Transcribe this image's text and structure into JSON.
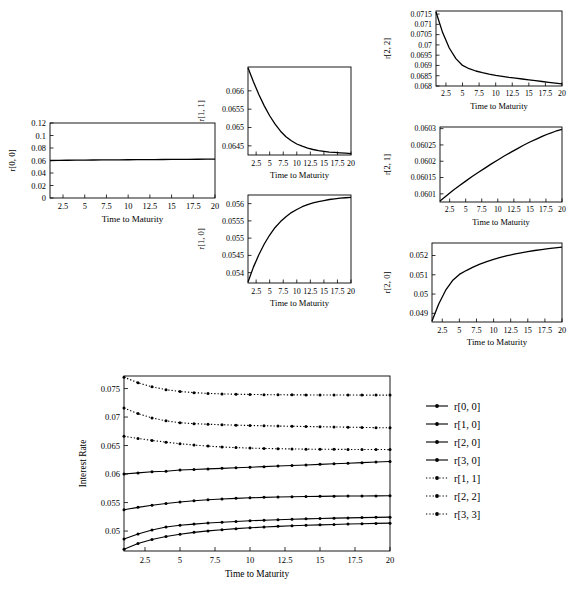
{
  "figure": {
    "axis_title_x": "Time to Maturity",
    "axis_title_y_main": "Interest Rate",
    "line_color": "#000000",
    "frame_color": "#000000",
    "background": "#ffffff"
  },
  "chart_data": [
    {
      "type": "line",
      "name": "r[0, 0]",
      "ylabel": "r[0, 0]",
      "xlabel": "Time to Maturity",
      "title": "",
      "grid": false,
      "xlim": [
        1,
        20
      ],
      "ylim": [
        0,
        0.12
      ],
      "xticks": [
        2.5,
        5,
        7.5,
        10,
        12.5,
        15,
        17.5,
        20
      ],
      "xtick_labels": [
        "2.5",
        "5",
        "7.5",
        "10",
        "12.5",
        "15",
        "17.5",
        "20"
      ],
      "yticks": [
        0,
        0.02,
        0.04,
        0.06,
        0.08,
        0.1,
        0.12
      ],
      "ytick_labels": [
        "0",
        "0.02",
        "0.04",
        "0.06",
        "0.08",
        "0.1",
        "0.12"
      ],
      "x": [
        1,
        2,
        3,
        4,
        5,
        6,
        7,
        8,
        9,
        10,
        11,
        12,
        13,
        14,
        15,
        16,
        17,
        18,
        19,
        20
      ],
      "values": [
        0.06,
        0.0602,
        0.0604,
        0.0605,
        0.0607,
        0.0608,
        0.0609,
        0.061,
        0.0611,
        0.0612,
        0.0613,
        0.0614,
        0.0615,
        0.0616,
        0.0617,
        0.0618,
        0.0619,
        0.062,
        0.0621,
        0.0622
      ]
    },
    {
      "type": "line",
      "name": "r[1, 1]",
      "ylabel": "r[1, 1]",
      "xlabel": "Time to Maturity",
      "title": "",
      "grid": false,
      "xlim": [
        1,
        20
      ],
      "ylim": [
        0.06425,
        0.06665
      ],
      "xticks": [
        2.5,
        5,
        7.5,
        10,
        12.5,
        15,
        17.5,
        20
      ],
      "xtick_labels": [
        "2.5",
        "5",
        "7.5",
        "10",
        "12.5",
        "15",
        "17.5",
        "20"
      ],
      "yticks": [
        0.0645,
        0.065,
        0.0655,
        0.066
      ],
      "ytick_labels": [
        "0.0645",
        "0.065",
        "0.0655",
        "0.066"
      ],
      "x": [
        1,
        2,
        3,
        4,
        5,
        6,
        7,
        8,
        9,
        10,
        11,
        12,
        13,
        14,
        15,
        16,
        17,
        18,
        19,
        20
      ],
      "values": [
        0.06663,
        0.06625,
        0.0659,
        0.06559,
        0.06532,
        0.06509,
        0.0649,
        0.06475,
        0.06464,
        0.06455,
        0.06449,
        0.06444,
        0.0644,
        0.06437,
        0.06435,
        0.06433,
        0.06432,
        0.06431,
        0.0643,
        0.06429
      ]
    },
    {
      "type": "line",
      "name": "r[1, 0]",
      "ylabel": "r[1, 0]",
      "xlabel": "Time to Maturity",
      "title": "",
      "grid": false,
      "xlim": [
        1,
        20
      ],
      "ylim": [
        0.0537,
        0.05625
      ],
      "xticks": [
        2.5,
        5,
        7.5,
        10,
        12.5,
        15,
        17.5,
        20
      ],
      "xtick_labels": [
        "2.5",
        "5",
        "7.5",
        "10",
        "12.5",
        "15",
        "17.5",
        "20"
      ],
      "yticks": [
        0.054,
        0.0545,
        0.055,
        0.0555,
        0.056
      ],
      "ytick_labels": [
        "0.054",
        "0.0545",
        "0.055",
        "0.0555",
        "0.056"
      ],
      "x": [
        1,
        2,
        3,
        4,
        5,
        6,
        7,
        8,
        9,
        10,
        11,
        12,
        13,
        14,
        15,
        16,
        17,
        18,
        19,
        20
      ],
      "values": [
        0.05373,
        0.05416,
        0.05452,
        0.05483,
        0.05509,
        0.05531,
        0.05548,
        0.05562,
        0.05574,
        0.05583,
        0.05591,
        0.05597,
        0.05602,
        0.05606,
        0.05609,
        0.05612,
        0.05614,
        0.05616,
        0.05617,
        0.05618
      ]
    },
    {
      "type": "line",
      "name": "r[2, 2]",
      "ylabel": "r[2, 2]",
      "xlabel": "Time to Maturity",
      "title": "",
      "grid": false,
      "xlim": [
        1,
        20
      ],
      "ylim": [
        0.068,
        0.07165
      ],
      "xticks": [
        2.5,
        5,
        7.5,
        10,
        12.5,
        15,
        17.5,
        20
      ],
      "xtick_labels": [
        "2.5",
        "5",
        "7.5",
        "10",
        "12.5",
        "15",
        "17.5",
        "20"
      ],
      "yticks": [
        0.068,
        0.0685,
        0.069,
        0.0695,
        0.07,
        0.0705,
        0.071,
        0.0715
      ],
      "ytick_labels": [
        "0.068",
        "0.0685",
        "0.069",
        "0.0695",
        "0.07",
        "0.0705",
        "0.071",
        "0.0715"
      ],
      "x": [
        1,
        2,
        3,
        4,
        5,
        6,
        7,
        8,
        9,
        10,
        11,
        12,
        13,
        14,
        15,
        16,
        17,
        18,
        19,
        20
      ],
      "values": [
        0.0716,
        0.0706,
        0.06985,
        0.06933,
        0.069,
        0.06884,
        0.06873,
        0.06865,
        0.06858,
        0.06852,
        0.06847,
        0.06842,
        0.06838,
        0.06834,
        0.0683,
        0.06826,
        0.06822,
        0.06818,
        0.06814,
        0.0681
      ]
    },
    {
      "type": "line",
      "name": "r[2, 1]",
      "ylabel": "r[2, 1]",
      "xlabel": "Time to Maturity",
      "title": "",
      "grid": false,
      "xlim": [
        1,
        20
      ],
      "ylim": [
        0.060075,
        0.060305
      ],
      "xticks": [
        2.5,
        5,
        7.5,
        10,
        12.5,
        15,
        17.5,
        20
      ],
      "xtick_labels": [
        "2.5",
        "5",
        "7.5",
        "10",
        "12.5",
        "15",
        "17.5",
        "20"
      ],
      "yticks": [
        0.0601,
        0.06015,
        0.0602,
        0.06025,
        0.0603
      ],
      "ytick_labels": [
        "0.0601",
        "0.06015",
        "0.0602",
        "0.06025",
        "0.0603"
      ],
      "x": [
        1,
        2,
        3,
        4,
        5,
        6,
        7,
        8,
        9,
        10,
        11,
        12,
        13,
        14,
        15,
        16,
        17,
        18,
        19,
        20
      ],
      "values": [
        0.060078,
        0.060094,
        0.06011,
        0.060125,
        0.060139,
        0.060153,
        0.060166,
        0.060179,
        0.060192,
        0.060204,
        0.060216,
        0.060227,
        0.060238,
        0.060249,
        0.060259,
        0.060268,
        0.060277,
        0.060285,
        0.060292,
        0.060298
      ]
    },
    {
      "type": "line",
      "name": "r[2, 0]",
      "ylabel": "r[2, 0]",
      "xlabel": "Time to Maturity",
      "title": "",
      "grid": false,
      "xlim": [
        1,
        20
      ],
      "ylim": [
        0.04855,
        0.05265
      ],
      "xticks": [
        2.5,
        5,
        7.5,
        10,
        12.5,
        15,
        17.5,
        20
      ],
      "xtick_labels": [
        "2.5",
        "5",
        "7.5",
        "10",
        "12.5",
        "15",
        "17.5",
        "20"
      ],
      "yticks": [
        0.049,
        0.05,
        0.051,
        0.052
      ],
      "ytick_labels": [
        "0.049",
        "0.05",
        "0.051",
        "0.052"
      ],
      "x": [
        1,
        2,
        3,
        4,
        5,
        6,
        7,
        8,
        9,
        10,
        11,
        12,
        13,
        14,
        15,
        16,
        17,
        18,
        19,
        20
      ],
      "values": [
        0.0486,
        0.0495,
        0.0502,
        0.0507,
        0.05102,
        0.05122,
        0.0514,
        0.05155,
        0.05168,
        0.0518,
        0.0519,
        0.05199,
        0.05207,
        0.05214,
        0.0522,
        0.05226,
        0.05231,
        0.05236,
        0.0524,
        0.05244
      ]
    },
    {
      "type": "line",
      "name": "combined-interest-rates",
      "title": "",
      "xlabel": "Time to Maturity",
      "ylabel": "Interest Rate",
      "grid": false,
      "xlim": [
        1,
        20
      ],
      "ylim": [
        0.0465,
        0.0772
      ],
      "xticks": [
        2.5,
        5,
        7.5,
        10,
        12.5,
        15,
        17.5,
        20
      ],
      "xtick_labels": [
        "2.5",
        "5",
        "7.5",
        "10",
        "12.5",
        "15",
        "17.5",
        "20"
      ],
      "yticks": [
        0.05,
        0.055,
        0.06,
        0.065,
        0.07,
        0.075
      ],
      "ytick_labels": [
        "0.05",
        "0.055",
        "0.06",
        "0.065",
        "0.07",
        "0.075"
      ],
      "x": [
        1,
        2,
        3,
        4,
        5,
        6,
        7,
        8,
        9,
        10,
        11,
        12,
        13,
        14,
        15,
        16,
        17,
        18,
        19,
        20
      ],
      "legend_position": "right",
      "series": [
        {
          "name": "r[0, 0]",
          "style": "solid",
          "marker": "dot",
          "values": [
            0.06,
            0.0602,
            0.0604,
            0.0605,
            0.0607,
            0.0608,
            0.0609,
            0.061,
            0.0611,
            0.0612,
            0.0613,
            0.0614,
            0.0615,
            0.0616,
            0.0617,
            0.0618,
            0.0619,
            0.062,
            0.0621,
            0.0622
          ]
        },
        {
          "name": "r[1, 0]",
          "style": "solid",
          "marker": "dot",
          "values": [
            0.05373,
            0.05416,
            0.05452,
            0.05483,
            0.05509,
            0.05531,
            0.05548,
            0.05562,
            0.05574,
            0.05583,
            0.05591,
            0.05597,
            0.05602,
            0.05606,
            0.05609,
            0.05612,
            0.05614,
            0.05616,
            0.05617,
            0.05618
          ]
        },
        {
          "name": "r[2, 0]",
          "style": "solid",
          "marker": "dot",
          "values": [
            0.0486,
            0.0495,
            0.0502,
            0.0507,
            0.05102,
            0.05122,
            0.0514,
            0.05155,
            0.05168,
            0.0518,
            0.0519,
            0.05199,
            0.05207,
            0.05214,
            0.0522,
            0.05226,
            0.05231,
            0.05236,
            0.0524,
            0.05244
          ]
        },
        {
          "name": "r[3, 0]",
          "style": "solid",
          "marker": "dot",
          "values": [
            0.0468,
            0.0478,
            0.04852,
            0.04905,
            0.04945,
            0.04977,
            0.05003,
            0.05024,
            0.05042,
            0.05057,
            0.0507,
            0.05082,
            0.05092,
            0.05101,
            0.05109,
            0.05116,
            0.05123,
            0.05129,
            0.05134,
            0.05139
          ]
        },
        {
          "name": "r[1, 1]",
          "style": "dotted",
          "marker": "dot",
          "values": [
            0.06663,
            0.06625,
            0.0659,
            0.06559,
            0.06532,
            0.06509,
            0.0649,
            0.06475,
            0.06464,
            0.06455,
            0.06449,
            0.06444,
            0.0644,
            0.06437,
            0.06435,
            0.06433,
            0.06432,
            0.06431,
            0.0643,
            0.06429
          ]
        },
        {
          "name": "r[2, 2]",
          "style": "dotted",
          "marker": "dot",
          "values": [
            0.0716,
            0.0706,
            0.06985,
            0.06933,
            0.069,
            0.06884,
            0.06873,
            0.06865,
            0.06858,
            0.06852,
            0.06847,
            0.06842,
            0.06838,
            0.06834,
            0.0683,
            0.06826,
            0.06822,
            0.06818,
            0.06814,
            0.0681
          ]
        },
        {
          "name": "r[3, 3]",
          "style": "dotted",
          "marker": "dot",
          "values": [
            0.077,
            0.076,
            0.0753,
            0.0748,
            0.07448,
            0.07428,
            0.07415,
            0.07406,
            0.074,
            0.07396,
            0.07393,
            0.07391,
            0.07389,
            0.07388,
            0.07387,
            0.07386,
            0.07386,
            0.07385,
            0.07385,
            0.07385
          ]
        }
      ]
    }
  ],
  "legend": {
    "items": [
      {
        "label": "r[0, 0]",
        "style": "solid"
      },
      {
        "label": "r[1, 0]",
        "style": "solid"
      },
      {
        "label": "r[2, 0]",
        "style": "solid"
      },
      {
        "label": "r[3, 0]",
        "style": "solid"
      },
      {
        "label": "r[1, 1]",
        "style": "dotted"
      },
      {
        "label": "r[2, 2]",
        "style": "dotted"
      },
      {
        "label": "r[3, 3]",
        "style": "dotted"
      }
    ]
  }
}
